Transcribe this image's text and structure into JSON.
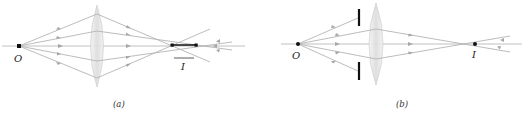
{
  "figure": {
    "panels": [
      {
        "id": "a",
        "caption": "(a)",
        "object_label": "O",
        "image_label": "I",
        "description": "Point object O imaged by a converging lens; rays through different lens zones focus at different points, producing an extended image segment I (spherical aberration)."
      },
      {
        "id": "b",
        "caption": "(b)",
        "object_label": "O",
        "image_label": "I",
        "description": "An aperture stop in front of the lens blocks marginal rays; only paraxial rays pass and converge to a sharp point image I."
      }
    ],
    "colors": {
      "ray": "#b4b4b4",
      "arrow": "#a0a0a0",
      "point": "#111111",
      "stop": "#111111",
      "lens_fill": "#e6e6e6",
      "lens_edge": "#c8c8c8",
      "axis": "#b4b4b4"
    }
  }
}
